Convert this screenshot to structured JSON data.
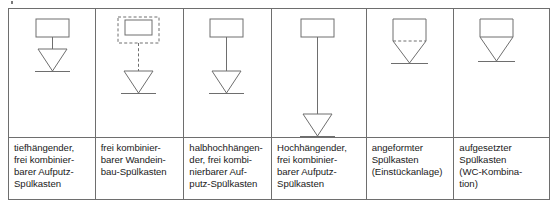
{
  "figure": {
    "kind": "technical-symbol-table",
    "line_color": "#6e6e6e",
    "text_color": "#1a1a1a",
    "background": "#ffffff"
  },
  "columns": [
    {
      "id": "tiefhaengender",
      "symbol_name": "cistern-low-level-symbol",
      "symbol": {
        "cistern_style": "solid",
        "connector_style": "solid",
        "connector_length": "short",
        "bowl": "triangle",
        "floor_line": true
      },
      "caption": "tiefhängender,\nfrei kombinier-\nbarer Aufputz-\nSpülkasten"
    },
    {
      "id": "wandeinbau",
      "symbol_name": "cistern-concealed-symbol",
      "symbol": {
        "cistern_style": "solid-in-dashed-box",
        "connector_style": "dashed",
        "connector_length": "medium",
        "bowl": "triangle",
        "floor_line": true
      },
      "caption": "frei kombinier-\nbarer Wandein-\nbau-Spülkasten"
    },
    {
      "id": "halbhochhaengender",
      "symbol_name": "cistern-mid-level-symbol",
      "symbol": {
        "cistern_style": "solid",
        "connector_style": "solid",
        "connector_length": "medium",
        "bowl": "triangle",
        "floor_line": true
      },
      "caption": "halbhochhängen-\nder, frei kombi-\nnierbarer Auf-\nputz-Spülkasten"
    },
    {
      "id": "hochhaengender",
      "symbol_name": "cistern-high-level-symbol",
      "symbol": {
        "cistern_style": "solid",
        "connector_style": "solid",
        "connector_length": "long",
        "bowl": "triangle",
        "floor_line": true
      },
      "caption": "Hochhängender,\nfrei kombinier-\nbarer Aufputz-\nSpülkasten"
    },
    {
      "id": "angeformter",
      "symbol_name": "cistern-integral-symbol",
      "symbol": {
        "cistern_style": "merged",
        "connector_style": "dashed-divider",
        "connector_length": "none",
        "bowl": "funnel",
        "floor_line": true
      },
      "caption": "angeformter\nSpülkasten\n(Einstückanlage)"
    },
    {
      "id": "aufgesetzter",
      "symbol_name": "cistern-close-coupled-symbol",
      "symbol": {
        "cistern_style": "merged",
        "connector_style": "solid-divider",
        "connector_length": "none",
        "bowl": "funnel",
        "floor_line": true
      },
      "caption": "aufgesetzter\nSpülkasten\n(WC-Kombina-\ntion)"
    }
  ]
}
